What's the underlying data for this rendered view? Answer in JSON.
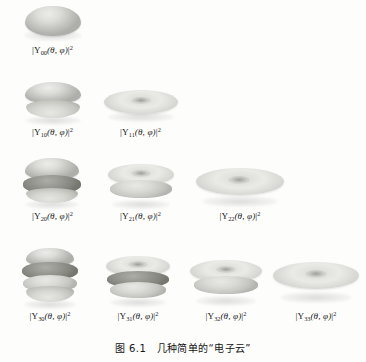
{
  "figure": {
    "caption": "图 6.1　几种简单的“电子云”",
    "caption_number": "6.1",
    "caption_text": "几种简单的“电子云”",
    "background_color": "#fdfdfc",
    "shape_color_light": "#e2e2df",
    "shape_color_mid": "#c2c2be",
    "shape_color_dark": "#868681"
  },
  "rows": [
    {
      "l": 0,
      "cells": [
        {
          "id": "Y00",
          "label_prefix": "|Y",
          "label_sub": "00",
          "label_args": "(θ, φ)",
          "label_suffix": "|",
          "label_sup": "2",
          "label_full": "|Y00(θ, φ)|²",
          "shape": "sphere",
          "shape_name": "single-sphere-lobe"
        }
      ]
    },
    {
      "l": 1,
      "cells": [
        {
          "id": "Y10",
          "label_prefix": "|Y",
          "label_sub": "10",
          "label_args": "(θ, φ)",
          "label_suffix": "|",
          "label_sup": "2",
          "label_full": "|Y10(θ, φ)|²",
          "shape": "two-stacked-lobes",
          "shape_name": "dumbbell-vertical"
        },
        {
          "id": "Y11",
          "label_prefix": "|Y",
          "label_sub": "11",
          "label_args": "(θ, φ)",
          "label_suffix": "|",
          "label_sup": "2",
          "label_full": "|Y11(θ, φ)|²",
          "shape": "flat-torus",
          "shape_name": "donut-disc"
        }
      ]
    },
    {
      "l": 2,
      "cells": [
        {
          "id": "Y20",
          "label_prefix": "|Y",
          "label_sub": "20",
          "label_args": "(θ, φ)",
          "label_suffix": "|",
          "label_sup": "2",
          "label_full": "|Y20(θ, φ)|²",
          "shape": "lobe-band-lobe",
          "shape_name": "dumbbell-with-ring"
        },
        {
          "id": "Y21",
          "label_prefix": "|Y",
          "label_sub": "21",
          "label_args": "(θ, φ)",
          "label_suffix": "|",
          "label_sup": "2",
          "label_full": "|Y21(θ, φ)|²",
          "shape": "double-torus",
          "shape_name": "stacked-rings"
        },
        {
          "id": "Y22",
          "label_prefix": "|Y",
          "label_sub": "22",
          "label_args": "(θ, φ)",
          "label_suffix": "|",
          "label_sup": "2",
          "label_full": "|Y22(θ, φ)|²",
          "shape": "wide-flat-torus",
          "shape_name": "wide-donut-disc"
        }
      ]
    },
    {
      "l": 3,
      "cells": [
        {
          "id": "Y30",
          "label_prefix": "|Y",
          "label_sub": "30",
          "label_args": "(θ, φ)",
          "label_suffix": "|",
          "label_sup": "2",
          "label_full": "|Y30(θ, φ)|²",
          "shape": "four-stacked-lobes",
          "shape_name": "multi-band-stack"
        },
        {
          "id": "Y31",
          "label_prefix": "|Y",
          "label_sub": "31",
          "label_args": "(θ, φ)",
          "label_suffix": "|",
          "label_sup": "2",
          "label_full": "|Y31(θ, φ)|²",
          "shape": "triple-torus",
          "shape_name": "stacked-rings-triple"
        },
        {
          "id": "Y32",
          "label_prefix": "|Y",
          "label_sub": "32",
          "label_args": "(θ, φ)",
          "label_suffix": "|",
          "label_sup": "2",
          "label_full": "|Y32(θ, φ)|²",
          "shape": "double-torus",
          "shape_name": "stacked-rings-double"
        },
        {
          "id": "Y33",
          "label_prefix": "|Y",
          "label_sub": "33",
          "label_args": "(θ, φ)",
          "label_suffix": "|",
          "label_sup": "2",
          "label_full": "|Y33(θ, φ)|²",
          "shape": "wide-flat-torus",
          "shape_name": "wide-donut-disc"
        }
      ]
    }
  ]
}
